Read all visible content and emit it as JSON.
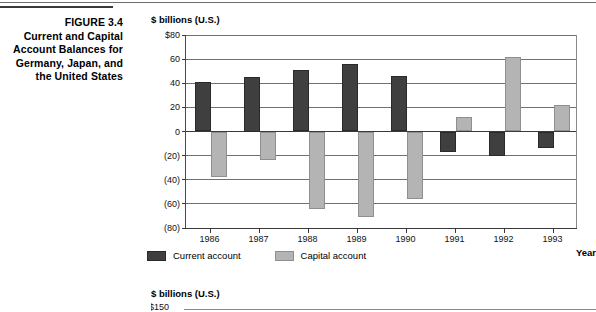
{
  "figure": {
    "caption_lines": [
      "FIGURE 3.4",
      "Current and Capital",
      "Account Balances for",
      "Germany, Japan, and",
      "the United States"
    ]
  },
  "chart_data": {
    "type": "bar",
    "title": "",
    "subtitle": "",
    "unit_label": "$ billions (U.S.)",
    "xlabel": "Year",
    "ylabel": "",
    "categories": [
      "1986",
      "1987",
      "1988",
      "1989",
      "1990",
      "1991",
      "1992",
      "1993"
    ],
    "series": [
      {
        "name": "Current account",
        "color": "#3f3f3f",
        "values": [
          41,
          45,
          51,
          56,
          46,
          -17,
          -20,
          -14
        ]
      },
      {
        "name": "Capital account",
        "color": "#b4b4b4",
        "values": [
          -38,
          -24,
          -64,
          -71,
          -56,
          12,
          62,
          22
        ]
      }
    ],
    "ylim": [
      -80,
      80
    ],
    "ytick_values": [
      80,
      60,
      40,
      20,
      0,
      -20,
      -40,
      -60,
      -80
    ],
    "ytick_labels": [
      "$80",
      "60",
      "40",
      "20",
      "0",
      "(20)",
      "(40)",
      "(60)",
      "(80)"
    ],
    "grid": true,
    "legend_position": "bottom-left"
  },
  "chart_below": {
    "unit_label": "$ billions (U.S.)",
    "first_ytick_label": "$150"
  }
}
